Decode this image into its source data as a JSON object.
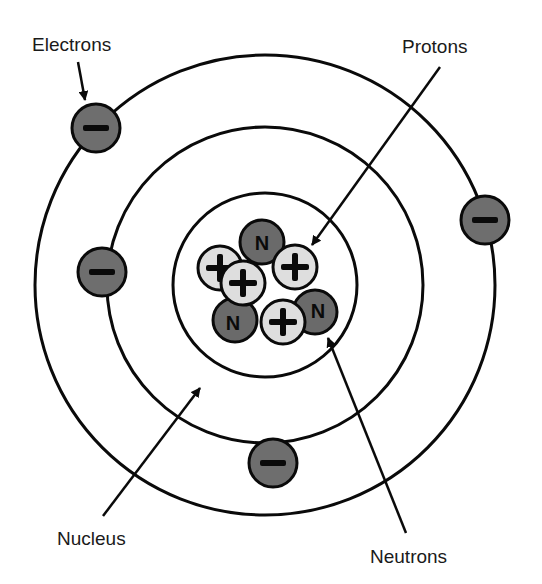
{
  "labels": {
    "electrons": "Electrons",
    "protons": "Protons",
    "nucleus": "Nucleus",
    "neutrons": "Neutrons"
  },
  "symbols": {
    "electron": "−",
    "proton": "+",
    "neutron": "N"
  },
  "colors": {
    "electron_fill": "#6e6e6e",
    "neutron_fill": "#6a6a6a",
    "proton_fill": "#dedede",
    "stroke": "#0a0a0a",
    "background": "#ffffff"
  },
  "orbits": [
    {
      "name": "nucleus-boundary",
      "cx": 265,
      "cy": 285,
      "r": 92
    },
    {
      "name": "inner-orbit",
      "cx": 265,
      "cy": 285,
      "r": 158
    },
    {
      "name": "outer-orbit",
      "cx": 265,
      "cy": 285,
      "r": 230
    }
  ],
  "electrons": [
    {
      "cx": 96,
      "cy": 128
    },
    {
      "cx": 485,
      "cy": 220
    },
    {
      "cx": 102,
      "cy": 272
    },
    {
      "cx": 273,
      "cy": 463
    }
  ],
  "nucleus": {
    "neutrons": [
      {
        "cx": 262,
        "cy": 242
      },
      {
        "cx": 235,
        "cy": 320
      },
      {
        "cx": 315,
        "cy": 312
      }
    ],
    "protons": [
      {
        "cx": 220,
        "cy": 268
      },
      {
        "cx": 295,
        "cy": 267
      },
      {
        "cx": 243,
        "cy": 283
      },
      {
        "cx": 283,
        "cy": 322
      }
    ]
  }
}
